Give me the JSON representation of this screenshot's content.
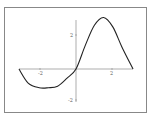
{
  "chart_data": {
    "type": "line",
    "title": "",
    "xlabel": "",
    "ylabel": "",
    "x_ticks": [
      "-2",
      "2"
    ],
    "y_ticks": [
      "2",
      "-2"
    ],
    "xlim": [
      -3.6,
      3.6
    ],
    "ylim": [
      -3.2,
      3.2
    ],
    "grid": false,
    "series": [
      {
        "name": "curve",
        "x": [
          -3.1,
          -2.6,
          -2.0,
          -1.5,
          -1.0,
          -0.5,
          0.0,
          0.5,
          1.0,
          1.5,
          2.0,
          2.5,
          3.1
        ],
        "y": [
          0.0,
          -0.9,
          -1.2,
          -1.2,
          -1.1,
          -0.6,
          0.0,
          1.5,
          2.8,
          3.3,
          2.7,
          1.4,
          0.0
        ]
      }
    ],
    "color": "#222222"
  },
  "labels": {
    "x_neg": "-2",
    "x_pos": "2",
    "y_pos": "2",
    "y_neg": "-2"
  }
}
